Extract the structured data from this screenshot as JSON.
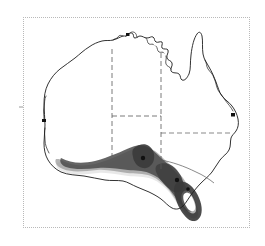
{
  "figure": {
    "type": "distribution-map",
    "region": "Australia",
    "frame": {
      "border_style": "dotted",
      "border_color": "#b9b9b9",
      "background_color": "#ffffff",
      "x": 23,
      "y": 17,
      "width": 227,
      "height": 211
    },
    "colors": {
      "coastline": "#1a1a1a",
      "state_border": "#555555",
      "shading_dark": "#3c3c3c",
      "shading_mid": "#8a8a8a",
      "shading_light": "#c4c4c4",
      "city_marker": "#111111",
      "land_fill": "#ffffff"
    },
    "axis_ticks": [
      {
        "name": "left-edge-tick",
        "side": "left",
        "x": 23,
        "y": 107
      }
    ],
    "shaded_zones": [
      {
        "name": "great-australian-bight-band",
        "label": "Great Australian Bight coastal band",
        "intensity": "mid"
      },
      {
        "name": "south-australia-gulfs-band",
        "label": "South Australia gulfs coastal band",
        "intensity": "dark"
      },
      {
        "name": "victoria-coast-band",
        "label": "Victoria coastal band",
        "intensity": "dark"
      },
      {
        "name": "tasmania-band",
        "label": "Tasmania coastal band",
        "intensity": "dark"
      },
      {
        "name": "southwest-wa-band",
        "label": "South-west Western Australia band",
        "intensity": "light"
      }
    ],
    "city_markers": [
      {
        "name": "city-marker-perth",
        "label": "Perth"
      },
      {
        "name": "city-marker-brisbane",
        "label": "Brisbane"
      },
      {
        "name": "city-marker-darwin",
        "label": "Darwin"
      },
      {
        "name": "city-marker-adelaide",
        "label": "Adelaide"
      },
      {
        "name": "city-marker-melbourne",
        "label": "Melbourne"
      },
      {
        "name": "city-marker-hobart",
        "label": "Hobart"
      }
    ],
    "state_borders": [
      {
        "name": "wa-nt-sa-border",
        "style": "dashed"
      },
      {
        "name": "nt-qld-border",
        "style": "dashed"
      },
      {
        "name": "sa-nt-border",
        "style": "dashed"
      },
      {
        "name": "sa-qld-nsw-border",
        "style": "dashed"
      },
      {
        "name": "nsw-vic-border",
        "style": "solid"
      },
      {
        "name": "nsw-qld-border",
        "style": "solid"
      }
    ]
  }
}
